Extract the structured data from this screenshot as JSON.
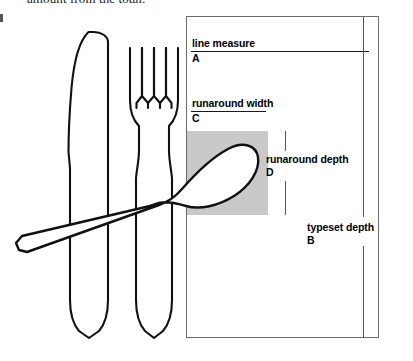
{
  "page": {
    "body_text": "amount from the total."
  },
  "diagram": {
    "name": "typography-runaround-diagram",
    "box_border_color": "#6b6b6b",
    "runaround_block_color": "#c9c9c9",
    "measures": [
      {
        "id": "line-measure",
        "label": "line measure",
        "key": "A"
      },
      {
        "id": "runaround-width",
        "label": "runaround width",
        "key": "C"
      },
      {
        "id": "runaround-depth",
        "label": "runaround depth",
        "key": "D"
      },
      {
        "id": "typeset-depth",
        "label": "typeset depth",
        "key": "B"
      }
    ],
    "illustration": {
      "name": "cutlery-illustration",
      "items": [
        "knife",
        "fork",
        "spoon"
      ],
      "stroke_color": "#111111",
      "fill_color": "#ffffff"
    }
  }
}
